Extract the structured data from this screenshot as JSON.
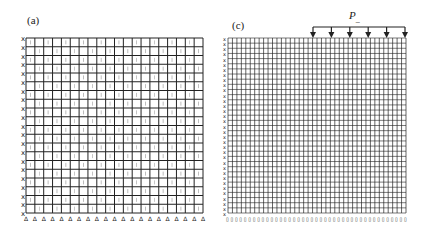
{
  "figure": {
    "panels": [
      {
        "id": "a",
        "label": "(a)",
        "mesh": {
          "columns": 20,
          "rows": 20,
          "x0": 26,
          "y0": 38,
          "x1": 203,
          "y1": 213
        }
      },
      {
        "id": "c",
        "label": "(c)",
        "mesh": {
          "columns": 40,
          "rows": 34,
          "x0": 228,
          "y0": 38,
          "x1": 406,
          "y1": 213
        },
        "load": {
          "label": "P",
          "subscript": "_",
          "arrows": 6,
          "x_start": 313,
          "x_end": 405,
          "bar_y": 27
        }
      }
    ],
    "colors": {
      "line": "#222222",
      "background": "#ffffff"
    }
  }
}
